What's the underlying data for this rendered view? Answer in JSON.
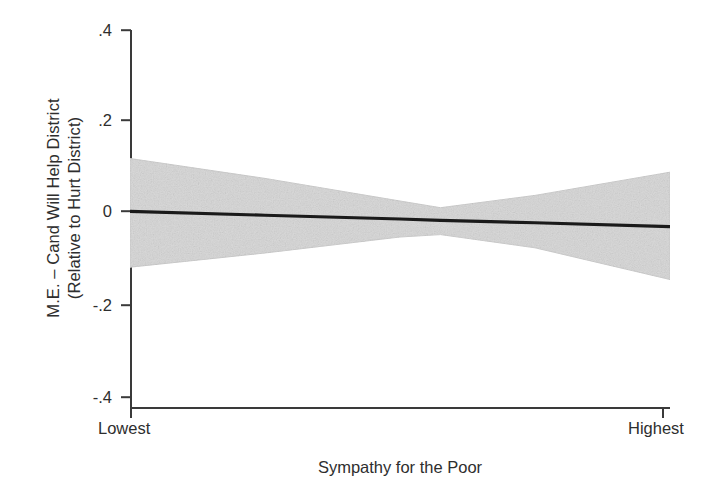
{
  "chart_data": {
    "type": "area",
    "title": "",
    "subtitle": "",
    "xlabel": "Sympathy for the Poor",
    "ylabel_line1": "M.E. – Cand Will Help District",
    "ylabel_line2": "(Relative to Hurt District)",
    "grid": false,
    "legend": false,
    "legend_position": "none",
    "xlim": [
      0,
      1
    ],
    "ylim": [
      -0.4,
      0.4
    ],
    "x_category_labels": [
      "Lowest",
      "Highest"
    ],
    "y_tick_labels": [
      ".4",
      ".2",
      "0",
      "-.2",
      "-.4"
    ],
    "y_tick_values": [
      0.4,
      0.2,
      0,
      -0.2,
      -0.4
    ],
    "colors": {
      "marginal_effect_line": "#1a1a1a",
      "confidence_band_fill": "#d9d9d9",
      "confidence_band_edge": "#c9c9c9",
      "axis": "#3a3a3a",
      "background": "#ffffff",
      "text": "#2e2e2e"
    },
    "series": [
      {
        "name": "Marginal effect",
        "x": [
          0,
          0.25,
          0.5,
          0.575,
          0.75,
          1
        ],
        "values": [
          0.016,
          0.008,
          0.0,
          -0.003,
          -0.008,
          -0.016
        ]
      },
      {
        "name": "95% CI upper",
        "x": [
          0,
          0.25,
          0.5,
          0.575,
          0.75,
          1
        ],
        "values": [
          0.128,
          0.086,
          0.038,
          0.024,
          0.05,
          0.099
        ]
      },
      {
        "name": "95% CI lower",
        "x": [
          0,
          0.25,
          0.5,
          0.575,
          0.75,
          1
        ],
        "values": [
          -0.102,
          -0.072,
          -0.038,
          -0.033,
          -0.061,
          -0.128
        ]
      }
    ],
    "annotations": []
  },
  "axes": {
    "y_ticks": [
      {
        "label": ".4",
        "value": 0.4
      },
      {
        "label": ".2",
        "value": 0.2
      },
      {
        "label": "0",
        "value": 0
      },
      {
        "label": "-.2",
        "value": -0.2
      },
      {
        "label": "-.4",
        "value": -0.4
      }
    ],
    "x_categories": [
      {
        "label": "Lowest"
      },
      {
        "label": "Highest"
      }
    ],
    "x_title": "Sympathy for the Poor",
    "y_title_line1": "M.E. – Cand Will Help District",
    "y_title_line2": "(Relative to Hurt District)"
  }
}
